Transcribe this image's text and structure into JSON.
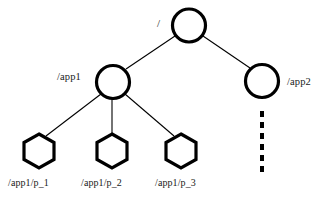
{
  "diagram": {
    "type": "tree",
    "title": "",
    "background_color": "#ffffff",
    "stroke_color": "#000000",
    "nodes": [
      {
        "id": "root",
        "shape": "circle",
        "label": "/",
        "label_position": "left",
        "cx": 189,
        "cy": 25.5,
        "r": 17,
        "stroke_width": 3
      },
      {
        "id": "app1",
        "shape": "circle",
        "label": "/app1",
        "label_position": "left",
        "cx": 113,
        "cy": 82,
        "r": 17,
        "stroke_width": 3
      },
      {
        "id": "app2",
        "shape": "circle",
        "label": "/app2",
        "label_position": "right",
        "cx": 262,
        "cy": 81,
        "r": 17,
        "stroke_width": 3
      },
      {
        "id": "p1",
        "shape": "hexagon",
        "label": "/app1/p_1",
        "label_position": "below",
        "cx": 39,
        "cy": 150,
        "r": 18,
        "stroke_width": 3
      },
      {
        "id": "p2",
        "shape": "hexagon",
        "label": "/app1/p_2",
        "label_position": "below",
        "cx": 112,
        "cy": 150,
        "r": 18,
        "stroke_width": 3
      },
      {
        "id": "p3",
        "shape": "hexagon",
        "label": "/app1/p_3",
        "label_position": "below",
        "cx": 181,
        "cy": 150,
        "r": 18,
        "stroke_width": 3
      }
    ],
    "edges": [
      {
        "from": "root",
        "to": "app1",
        "style": "solid"
      },
      {
        "from": "root",
        "to": "app2",
        "style": "solid"
      },
      {
        "from": "app1",
        "to": "p1",
        "style": "solid"
      },
      {
        "from": "app1",
        "to": "p2",
        "style": "solid"
      },
      {
        "from": "app1",
        "to": "p3",
        "style": "solid"
      }
    ],
    "continuation": {
      "from": "app2",
      "style": "dashed-vertical",
      "label": "",
      "x": 262,
      "y_start": 110,
      "y_end": 174,
      "dash_length": 6,
      "dash_gap": 5,
      "stroke_width": 4
    },
    "labels": {
      "root": "/",
      "app1": "/app1",
      "app2": "/app2",
      "p1": "/app1/p_1",
      "p2": "/app1/p_2",
      "p3": "/app1/p_3"
    }
  }
}
